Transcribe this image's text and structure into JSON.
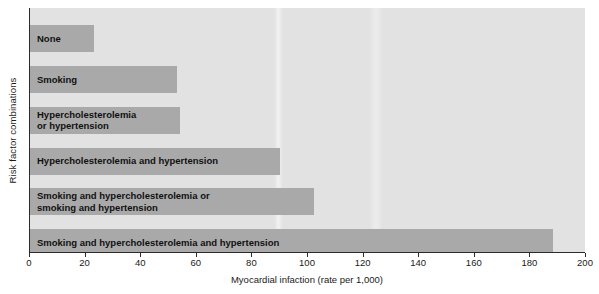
{
  "chart_data": {
    "type": "bar",
    "orientation": "horizontal",
    "title": "",
    "xlabel": "Myocardial infaction (rate per 1,000)",
    "ylabel": "Risk factor combinations",
    "xlim": [
      0,
      200
    ],
    "xticks": [
      0,
      20,
      40,
      60,
      80,
      100,
      120,
      140,
      160,
      180,
      200
    ],
    "grid": false,
    "legend": null,
    "categories": [
      "None",
      "Smoking",
      "Hypercholesterolemia or hypertension",
      "Hypercholesterolemia and hypertension",
      "Smoking and hypercholesterolemia or smoking and hypertension",
      "Smoking and hypercholesterolemia and hypertension"
    ],
    "values": [
      23,
      53,
      54,
      90,
      102,
      188
    ],
    "bars": [
      {
        "label_line1": "None",
        "label_line2": "",
        "value": 23
      },
      {
        "label_line1": "Smoking",
        "label_line2": "",
        "value": 53
      },
      {
        "label_line1": "Hypercholesterolemia",
        "label_line2": "or hypertension",
        "value": 54
      },
      {
        "label_line1": "Hypercholesterolemia and hypertension",
        "label_line2": "",
        "value": 90
      },
      {
        "label_line1": "Smoking and hypercholesterolemia or",
        "label_line2": "smoking and hypertension",
        "value": 102
      },
      {
        "label_line1": "Smoking and hypercholesterolemia and hypertension",
        "label_line2": "",
        "value": 188
      }
    ]
  },
  "colors": {
    "plot_background": "#e2e2e2",
    "bar_fill": "#a9a9a9",
    "axis": "#2b2b2b",
    "text": "#1a1a1a",
    "page_background": "#ffffff"
  }
}
